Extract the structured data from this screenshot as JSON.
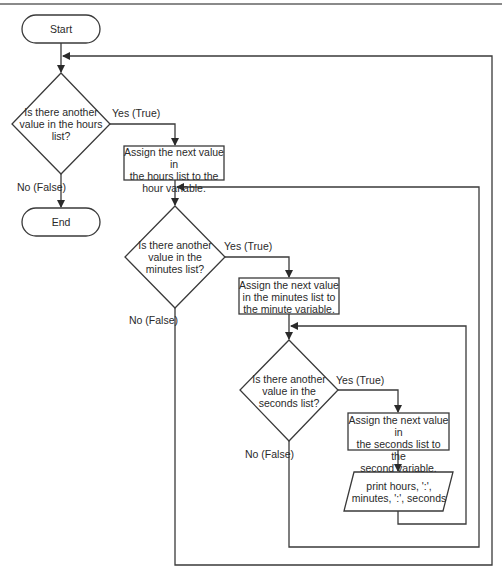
{
  "flowchart": {
    "start": "Start",
    "end": "End",
    "decisions": [
      {
        "id": "hours",
        "text": "Is there another\nvalue in the hours\nlist?",
        "yes": "Yes (True)",
        "no": "No (False)"
      },
      {
        "id": "minutes",
        "text": "Is there another\nvalue in the\nminutes list?",
        "yes": "Yes (True)",
        "no": "No (False)"
      },
      {
        "id": "seconds",
        "text": "Is there another\nvalue in the\nseconds list?",
        "yes": "Yes (True)",
        "no": "No (False)"
      }
    ],
    "processes": [
      {
        "id": "assign-hour",
        "text": "Assign the next value in\nthe hours list to the\nhour variable."
      },
      {
        "id": "assign-minute",
        "text": "Assign the next value\nin the minutes list to\nthe minute variable."
      },
      {
        "id": "assign-second",
        "text": "Assign the next value in\nthe seconds list to the\nsecond variable."
      }
    ],
    "output": {
      "text": "print hours, ':',\nminutes, ':', seconds"
    }
  }
}
